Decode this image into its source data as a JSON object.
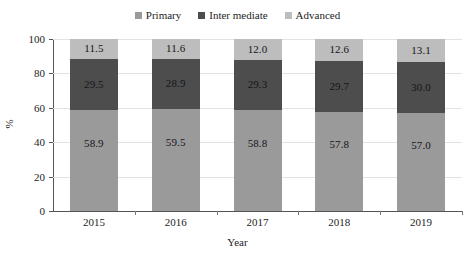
{
  "chart_data": {
    "type": "bar",
    "subtype": "stacked-100-percent",
    "title": "",
    "xlabel": "Year",
    "ylabel": "%",
    "ylim": [
      0,
      100
    ],
    "yticks": [
      0,
      20,
      40,
      60,
      80,
      100
    ],
    "ytick_labels": [
      "0",
      "20",
      "40",
      "60",
      "80",
      "100"
    ],
    "grid": true,
    "grid_axis": "y",
    "legend_position": "top-center",
    "categories": [
      "2015",
      "2016",
      "2017",
      "2018",
      "2019"
    ],
    "series": [
      {
        "name": "Primary",
        "color": "#9a9a9a",
        "values": [
          58.9,
          59.5,
          58.8,
          57.8,
          57.0
        ],
        "labels": [
          "58.9",
          "59.5",
          "58.8",
          "57.8",
          "57.0"
        ]
      },
      {
        "name": "Inter mediate",
        "color": "#4d4d4d",
        "values": [
          29.5,
          28.9,
          29.3,
          29.7,
          30.0
        ],
        "labels": [
          "29.5",
          "28.9",
          "29.3",
          "29.7",
          "30.0"
        ]
      },
      {
        "name": "Advanced",
        "color": "#bdbdbd",
        "values": [
          11.5,
          11.6,
          12.0,
          12.6,
          13.1
        ],
        "labels": [
          "11.5",
          "11.6",
          "12.0",
          "12.6",
          "13.1"
        ]
      }
    ]
  },
  "legend": {
    "items": [
      {
        "label": "Primary",
        "color": "#9a9a9a"
      },
      {
        "label": "Inter mediate",
        "color": "#4d4d4d"
      },
      {
        "label": "Advanced",
        "color": "#bdbdbd"
      }
    ]
  },
  "axes": {
    "x_title": "Year",
    "y_title": "%",
    "y_tick_labels": [
      "100",
      "80",
      "60",
      "40",
      "20",
      "0"
    ],
    "x_tick_labels": [
      "2015",
      "2016",
      "2017",
      "2018",
      "2019"
    ]
  }
}
